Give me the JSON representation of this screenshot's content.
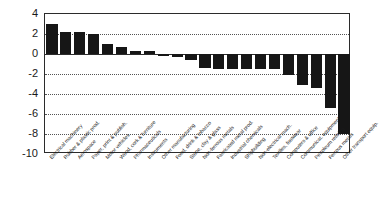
{
  "chart_data": {
    "type": "bar",
    "title": "",
    "subtitle": "",
    "xlabel": "",
    "ylabel": "",
    "ylim": [
      -10,
      4
    ],
    "grid": true,
    "legend": false,
    "orientation": "vertical",
    "bar_color": "#161616",
    "categories": [
      "Electrical machinery",
      "Rubber & plastic prod.",
      "Aerospace",
      "Paper, print & publish.",
      "Motor vehicles",
      "Wood, cork & furniture",
      "Pharmaceuticals",
      "Instruments",
      "Other manufacturing",
      "Food, drink & tobacco",
      "Stone, clay & glass",
      "Non-ferrous metals",
      "Fabricated metal prod.",
      "Industrial chemicals",
      "Shipbuilding",
      "Non-electrical mach.",
      "Textiles, footwear",
      "Computers & office",
      "Communicat. equipment",
      "Petroleum refining",
      "Ferrous metals",
      "Other transport equip."
    ],
    "values": [
      3.0,
      2.25,
      2.2,
      2.0,
      1.05,
      0.7,
      0.3,
      0.3,
      0.0,
      -0.3,
      -0.6,
      -1.4,
      -1.5,
      -1.5,
      -1.5,
      -1.5,
      -1.5,
      -2.1,
      -3.1,
      -3.4,
      -5.4,
      -8.0
    ],
    "y_ticks": [
      4,
      2,
      0,
      -2,
      -4,
      -6,
      -8,
      -10
    ],
    "y_tick_labels": [
      "4",
      "2",
      "0",
      "-2",
      "-4",
      "-6",
      "-8",
      "-10"
    ]
  }
}
